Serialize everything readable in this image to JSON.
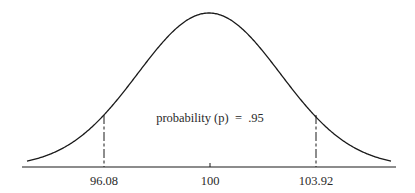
{
  "chart_data": {
    "type": "line",
    "title": "",
    "subtitle": "",
    "xlabel": "",
    "ylabel": "",
    "distribution": {
      "mean": 100,
      "lower_bound": 96.08,
      "upper_bound": 103.92
    },
    "x_ticks": [
      {
        "value": 96.08,
        "label": "96.08"
      },
      {
        "value": 100,
        "label": "100"
      },
      {
        "value": 103.92,
        "label": "103.92"
      }
    ],
    "annotations": [
      {
        "text": "probability (p)  =  .95",
        "position": "center-inside-curve"
      }
    ],
    "grid": false,
    "legend": null,
    "colors": {
      "line": "#1a1a1a",
      "background": "#ffffff"
    }
  },
  "labels": {
    "annotation": "probability (p)  =  .95",
    "tick_left": "96.08",
    "tick_center": "100",
    "tick_right": "103.92"
  }
}
